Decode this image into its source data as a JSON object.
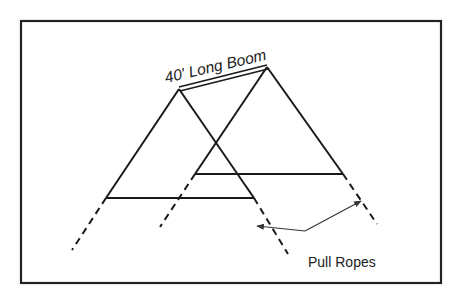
{
  "diagram": {
    "boom_label": "40' Long Boom",
    "ropes_label": "Pull Ropes",
    "colors": {
      "frame": "#222222",
      "line": "#1a1a1a",
      "arrow": "#333333",
      "background": "#ffffff"
    }
  }
}
